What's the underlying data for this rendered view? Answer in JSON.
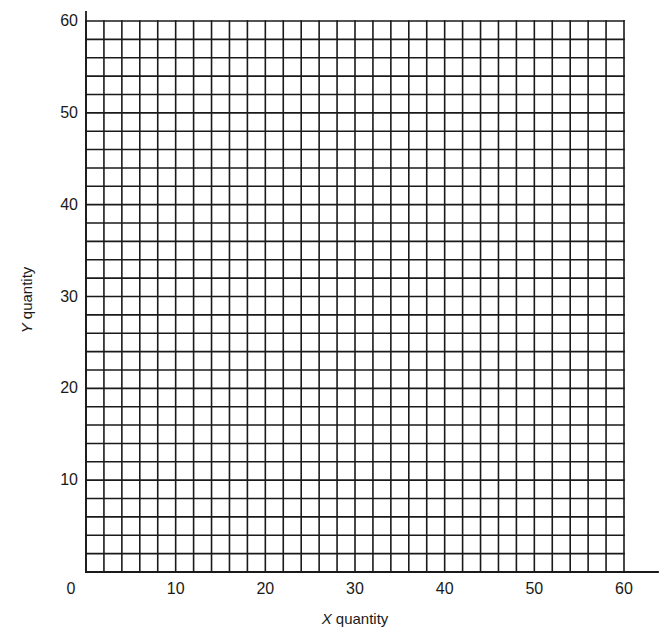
{
  "chart_data": {
    "type": "grid",
    "title": "",
    "xlabel": "X quantity",
    "ylabel": "Y quantity",
    "xlabel_parts": {
      "var": "X",
      "rest": " quantity"
    },
    "ylabel_parts": {
      "var": "Y",
      "rest": " quantity"
    },
    "xlim": [
      0,
      60
    ],
    "ylim": [
      0,
      60
    ],
    "x_ticks": [
      0,
      10,
      20,
      30,
      40,
      50,
      60
    ],
    "y_ticks": [
      10,
      20,
      30,
      40,
      50,
      60
    ],
    "x_tick_labels": [
      "0",
      "10",
      "20",
      "30",
      "40",
      "50",
      "60"
    ],
    "y_tick_labels": [
      "10",
      "20",
      "30",
      "40",
      "50",
      "60"
    ],
    "grid": true,
    "grid_spacing": 2,
    "series": [],
    "legend": null,
    "colors": {
      "line": "#1a1a1a",
      "background": "#ffffff"
    }
  },
  "layout": {
    "plot_left_px": 86,
    "plot_right_px": 624,
    "plot_top_px": 21,
    "plot_bottom_px": 572,
    "y_axis_top_px": 12,
    "x_axis_right_px": 658
  }
}
